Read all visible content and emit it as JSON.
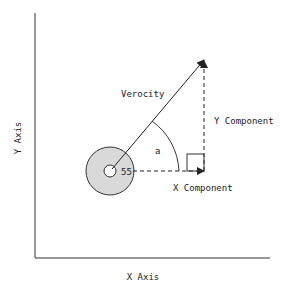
{
  "diagram": {
    "x_axis_label": "X Axis",
    "y_axis_label": "Y Axis",
    "velocity_label": "Verocity",
    "y_component_label": "Y Component",
    "x_component_label": "X Component",
    "angle_label": "a",
    "object_label": "55",
    "colors": {
      "line": "#222222",
      "circle_fill": "#d9d9d9",
      "background": "#ffffff"
    }
  }
}
